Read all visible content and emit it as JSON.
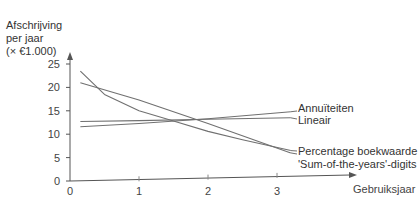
{
  "chart_data": {
    "type": "line",
    "title": "",
    "ylabel_lines": [
      "Afschrijving",
      "per jaar",
      "(× €1.000)"
    ],
    "xlabel": "Gebruiksjaar",
    "x_ticks": [
      "0",
      "1",
      "2",
      "3"
    ],
    "y_ticks": [
      "0",
      "5",
      "10",
      "15",
      "20",
      "25"
    ],
    "xlim": [
      0,
      3.6
    ],
    "ylim": [
      0,
      27
    ],
    "grid": false,
    "legend_position": "inline-right",
    "series": [
      {
        "name": "Annuïteiten",
        "x": [
          0.15,
          1.0,
          2.0,
          3.2
        ],
        "values": [
          11.6,
          12.3,
          13.3,
          14.8
        ]
      },
      {
        "name": "Lineair",
        "x": [
          0.15,
          1.0,
          2.0,
          3.2
        ],
        "values": [
          12.7,
          12.9,
          13.2,
          13.5
        ]
      },
      {
        "name": "Percentage boekwaarde",
        "x": [
          0.15,
          0.5,
          1.0,
          1.5,
          2.0,
          2.5,
          3.2
        ],
        "values": [
          23.5,
          18.5,
          15.0,
          12.8,
          10.6,
          8.8,
          6.5
        ]
      },
      {
        "name": "'Sum-of-the-years'-digits",
        "x": [
          0.15,
          1.0,
          2.0,
          3.2
        ],
        "values": [
          21.0,
          17.3,
          12.3,
          6.0
        ]
      }
    ]
  }
}
